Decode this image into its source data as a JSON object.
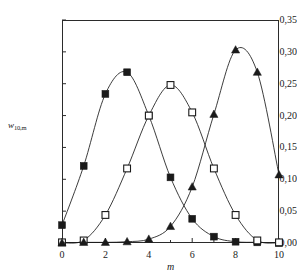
{
  "chart_data": {
    "type": "line",
    "title": "",
    "subtitle": "",
    "xlabel": "m",
    "ylabel": "w",
    "ylabel_subscript": "10,m",
    "ylabel_full": "w10,m",
    "x": [
      0,
      1,
      2,
      3,
      4,
      5,
      6,
      7,
      8,
      9,
      10
    ],
    "xlim": [
      0,
      10
    ],
    "ylim": [
      0.0,
      0.35
    ],
    "grid": false,
    "legend": "none",
    "decimal_separator": ",",
    "xticks": [
      0,
      2,
      4,
      6,
      8,
      10
    ],
    "xtick_labels": [
      "0",
      "2",
      "4",
      "6",
      "8",
      "10"
    ],
    "xminor_ticks": [
      0,
      1,
      2,
      3,
      4,
      5,
      6,
      7,
      8,
      9,
      10
    ],
    "yticks": [
      0.0,
      0.05,
      0.1,
      0.15,
      0.2,
      0.25,
      0.3,
      0.35
    ],
    "ytick_labels": [
      "0,00",
      "0,05",
      "0,10",
      "0,15",
      "0,20",
      "0,25",
      "0,30",
      "0,35"
    ],
    "series": [
      {
        "name": "filled-square",
        "marker": "filled-square",
        "color": "#1a1a1a",
        "values": [
          0.028,
          0.121,
          0.234,
          0.268,
          0.2,
          0.103,
          0.038,
          0.01,
          0.002,
          0.001,
          0.0
        ]
      },
      {
        "name": "open-square",
        "marker": "open-square",
        "color": "#1a1a1a",
        "values": [
          0.001,
          0.004,
          0.044,
          0.117,
          0.2,
          0.248,
          0.205,
          0.117,
          0.044,
          0.004,
          0.001
        ]
      },
      {
        "name": "filled-triangle",
        "marker": "filled-triangle",
        "color": "#1a1a1a",
        "values": [
          0.0,
          0.001,
          0.001,
          0.002,
          0.006,
          0.026,
          0.088,
          0.202,
          0.303,
          0.268,
          0.107
        ]
      }
    ]
  }
}
